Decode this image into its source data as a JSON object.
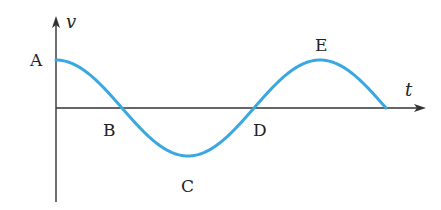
{
  "diagram": {
    "type": "velocity-time graph (cosine wave)",
    "axes": {
      "y_label": "v",
      "x_label": "t",
      "origin_px": [
        56,
        108
      ],
      "y_axis_top_px": 18,
      "y_axis_bottom_px": 202,
      "x_axis_end_px": 424
    },
    "curve": {
      "shape": "cosine",
      "amplitude_px": 48,
      "period_px": 264,
      "start_x_px": 56,
      "end_x_px": 386,
      "color": "#3aa8e0"
    },
    "points": [
      {
        "id": "A",
        "label": "A",
        "description": "maximum at t=0",
        "label_pos": [
          30,
          66
        ]
      },
      {
        "id": "B",
        "label": "B",
        "description": "zero crossing (descending)",
        "label_pos": [
          103,
          136
        ]
      },
      {
        "id": "C",
        "label": "C",
        "description": "minimum",
        "label_pos": [
          181,
          192
        ]
      },
      {
        "id": "D",
        "label": "D",
        "description": "zero crossing (ascending)",
        "label_pos": [
          253,
          136
        ]
      },
      {
        "id": "E",
        "label": "E",
        "description": "maximum",
        "label_pos": [
          315,
          51
        ]
      }
    ],
    "colors": {
      "axis": "#333333",
      "curve": "#3aa8e0",
      "text": "#222222",
      "background": "#ffffff"
    }
  }
}
